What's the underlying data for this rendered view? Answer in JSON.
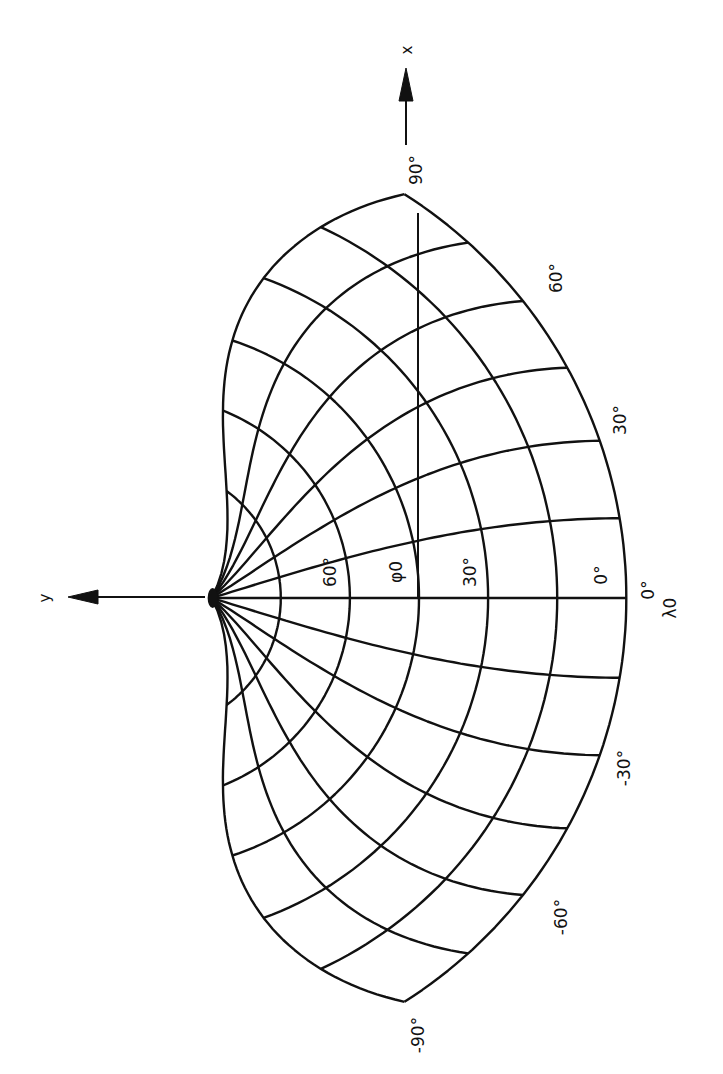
{
  "figure": {
    "projection": "Bonne",
    "standard_parallel_symbol": "φ0",
    "central_meridian_symbol": "λ0",
    "rotation_deg": -90
  },
  "axes": {
    "x_label": "x",
    "y_label": "y"
  },
  "graticule": {
    "parallels_deg": [
      0,
      15,
      30,
      45,
      60,
      75
    ],
    "meridians_deg": [
      -90,
      -75,
      -60,
      -45,
      -30,
      -15,
      0,
      15,
      30,
      45,
      60,
      75,
      90
    ],
    "standard_parallel_deg": 45,
    "color": "#111111"
  },
  "labels": {
    "longitude": [
      {
        "text": "90°",
        "lon": 90
      },
      {
        "text": "60°",
        "lon": 60
      },
      {
        "text": "30°",
        "lon": 30
      },
      {
        "text": "0°",
        "lon": 0
      },
      {
        "text": "-30°",
        "lon": -30
      },
      {
        "text": "-60°",
        "lon": -60
      },
      {
        "text": "-90°",
        "lon": -90
      }
    ],
    "latitude": [
      {
        "text": "60°",
        "lat": 60
      },
      {
        "text": "φ0",
        "lat": 45
      },
      {
        "text": "30°",
        "lat": 30
      },
      {
        "text": "0°",
        "lat": 0
      }
    ],
    "lambda0": "λ0"
  }
}
